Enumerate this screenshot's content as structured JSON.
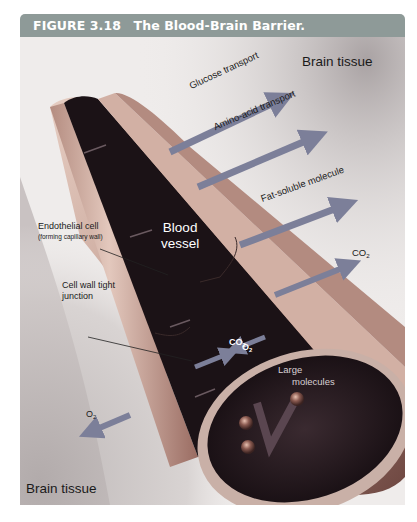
{
  "figure": {
    "number": "FIGURE 3.18",
    "title": "The Blood-Brain Barrier."
  },
  "labels": {
    "brain_tissue_top": "Brain tissue",
    "brain_tissue_bottom": "Brain tissue",
    "glucose_transport": "Glucose transport",
    "amino_acid_transport": "Amino-acid transport",
    "fat_soluble_molecule": "Fat-soluble molecule",
    "co2_out": "CO",
    "co2_out_sub": "2",
    "endothelial_cell": "Endothelial cell",
    "endothelial_cell_note": "(forming capillary wall)",
    "blood_vessel_line1": "Blood",
    "blood_vessel_line2": "vessel",
    "cell_wall_tight_line1": "Cell wall tight",
    "cell_wall_tight_line2": "junction",
    "co2_in": "CO",
    "co2_in_sub": "2",
    "o2_in": "O",
    "o2_in_sub": "2",
    "o2_out": "O",
    "o2_out_sub": "2",
    "large_molecules_line1": "Large",
    "large_molecules_line2": "molecules"
  },
  "colors": {
    "header_bg": "#8e9a98",
    "tissue_bg": "#efeceb",
    "tissue_dark": "#b9b3b3",
    "vessel_wall": "#d6b7ab",
    "vessel_interior": "#1e1418",
    "arrow": "#7c7f99"
  }
}
